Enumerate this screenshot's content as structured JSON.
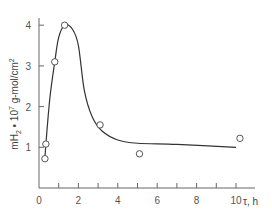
{
  "chart_data": {
    "type": "scatter",
    "title": "",
    "xlabel": "τ, h",
    "ylabel_parts": {
      "m": "m",
      "h": "H",
      "sub": "2",
      "dot": " • 10",
      "exp": "7",
      "unit": " g-mol/cm",
      "unit_exp": "2"
    },
    "ylabel": "mH2 • 10^7 g-mol/cm^2",
    "xlim": [
      0,
      11
    ],
    "ylim": [
      0,
      4.2
    ],
    "x_ticks_labeled": [
      0,
      2,
      4,
      6,
      8,
      10
    ],
    "x_ticks_minor": [
      1,
      3,
      5,
      7,
      9
    ],
    "y_ticks": [
      1,
      2,
      3,
      4
    ],
    "grid": false,
    "legend": null,
    "series": [
      {
        "name": "measured",
        "kind": "markers",
        "marker": "open-circle",
        "points": [
          {
            "x": 0.3,
            "y": 0.72
          },
          {
            "x": 0.35,
            "y": 1.08
          },
          {
            "x": 0.8,
            "y": 3.1
          },
          {
            "x": 1.3,
            "y": 4.0
          },
          {
            "x": 3.1,
            "y": 1.55
          },
          {
            "x": 5.1,
            "y": 0.84
          },
          {
            "x": 10.2,
            "y": 1.22
          }
        ]
      },
      {
        "name": "fitted-curve",
        "kind": "line",
        "points": [
          {
            "x": 0.3,
            "y": 0.72
          },
          {
            "x": 0.35,
            "y": 1.08
          },
          {
            "x": 0.55,
            "y": 2.2
          },
          {
            "x": 0.8,
            "y": 3.1
          },
          {
            "x": 1.0,
            "y": 3.7
          },
          {
            "x": 1.3,
            "y": 4.0
          },
          {
            "x": 1.7,
            "y": 3.9
          },
          {
            "x": 2.0,
            "y": 3.5
          },
          {
            "x": 2.3,
            "y": 2.4
          },
          {
            "x": 2.7,
            "y": 1.75
          },
          {
            "x": 3.2,
            "y": 1.4
          },
          {
            "x": 4.0,
            "y": 1.18
          },
          {
            "x": 5.0,
            "y": 1.1
          },
          {
            "x": 7.0,
            "y": 1.07
          },
          {
            "x": 10.0,
            "y": 1.0
          }
        ]
      }
    ]
  },
  "labels": {
    "x_axis": "τ, h",
    "x_ticks": [
      "0",
      "2",
      "4",
      "6",
      "8",
      "10"
    ],
    "y_ticks": [
      "1",
      "2",
      "3",
      "4"
    ]
  },
  "colors": {
    "axis": "#666666",
    "curve": "#333333",
    "marker_stroke": "#555555",
    "marker_fill": "#ffffff"
  }
}
